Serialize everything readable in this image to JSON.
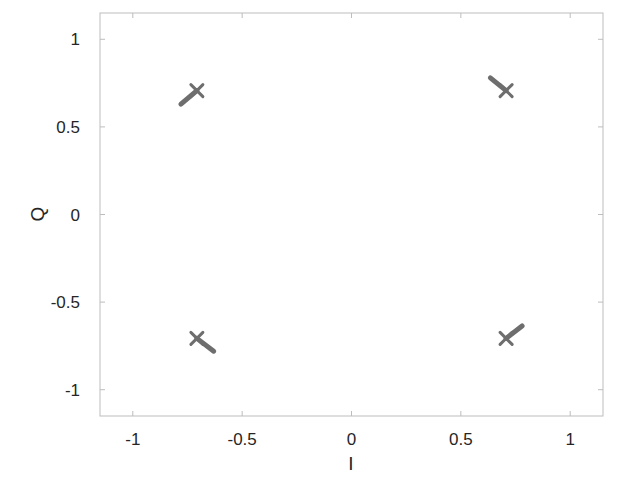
{
  "chart_data": {
    "type": "scatter",
    "title": "",
    "xlabel": "I",
    "ylabel": "Q",
    "xlim": [
      -1.15,
      1.15
    ],
    "ylim": [
      -1.15,
      1.15
    ],
    "grid": false,
    "legend": null,
    "x_ticks": [
      -1,
      -0.5,
      0,
      0.5,
      1
    ],
    "y_ticks": [
      -1,
      -0.5,
      0,
      0.5,
      1
    ],
    "x_tick_labels": [
      "-1",
      "-0.5",
      "0",
      "0.5",
      "1"
    ],
    "y_tick_labels": [
      "-1",
      "-0.5",
      "0",
      "0.5",
      "1"
    ],
    "series": [
      {
        "name": "constellation points",
        "marker": "x",
        "color": "#6e6e6e",
        "points": [
          {
            "x": -0.707,
            "y": 0.707
          },
          {
            "x": 0.707,
            "y": 0.707
          },
          {
            "x": -0.707,
            "y": -0.707
          },
          {
            "x": 0.707,
            "y": -0.707
          }
        ]
      },
      {
        "name": "trajectories",
        "marker": "line",
        "color": "#6e6e6e",
        "segments": [
          {
            "from": {
              "x": -0.78,
              "y": 0.63
            },
            "to": {
              "x": -0.707,
              "y": 0.707
            }
          },
          {
            "from": {
              "x": 0.635,
              "y": 0.78
            },
            "to": {
              "x": 0.707,
              "y": 0.707
            }
          },
          {
            "from": {
              "x": -0.63,
              "y": -0.78
            },
            "to": {
              "x": -0.707,
              "y": -0.707
            }
          },
          {
            "from": {
              "x": 0.78,
              "y": -0.636
            },
            "to": {
              "x": 0.707,
              "y": -0.707
            }
          }
        ]
      }
    ]
  },
  "colors": {
    "axes": "#bdbdbd",
    "text": "#262626",
    "marker": "#6e6e6e"
  }
}
